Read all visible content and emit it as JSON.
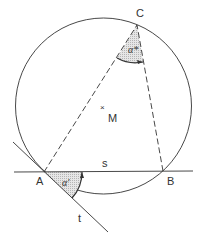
{
  "diagram": {
    "type": "geometry-inscribed-angle-tangent-chord",
    "colors": {
      "stroke": "#333333",
      "shade": "#d9d9d9",
      "background": "#ffffff"
    },
    "circle": {
      "center_label": "M",
      "center_marker": "×"
    },
    "points": {
      "A": {
        "label": "A"
      },
      "B": {
        "label": "B"
      },
      "C": {
        "label": "C"
      }
    },
    "lines": {
      "secant": {
        "label": "s"
      },
      "tangent": {
        "label": "t"
      }
    },
    "angles": {
      "inscribed": {
        "label": "α*"
      },
      "tangent_chord": {
        "label": "α'"
      }
    }
  }
}
